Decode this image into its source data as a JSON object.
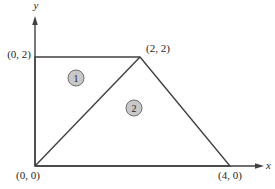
{
  "figure": {
    "background_color": "#ffffff",
    "line_color": "#404040",
    "label_color": "#1f1f1f",
    "axes": {
      "x_label": "x",
      "y_label": "y",
      "origin_px": {
        "x": 35,
        "y": 166
      },
      "x_axis_end_px": {
        "x": 256,
        "y": 166
      },
      "x_arrow_tip_px": {
        "x": 264,
        "y": 166
      },
      "y_axis_end_px": {
        "x": 35,
        "y": 24
      },
      "y_arrow_tip_px": {
        "x": 35,
        "y": 16
      },
      "x_label_px": {
        "x": 266,
        "y": 169
      },
      "y_label_px": {
        "x": 36,
        "y": 9
      }
    },
    "shape": {
      "outline_px": [
        [
          35,
          166
        ],
        [
          35,
          57
        ],
        [
          140,
          57
        ],
        [
          230,
          166
        ]
      ],
      "diagonal_px": [
        [
          35,
          166
        ],
        [
          140,
          57
        ]
      ]
    },
    "vertex_labels": [
      {
        "text": "(0, 2)",
        "x": 31,
        "y": 58,
        "anchor": "end"
      },
      {
        "text": "(2, 2)",
        "x": 146,
        "y": 52,
        "anchor": "start"
      },
      {
        "text": "(0, 0)",
        "x": 28,
        "y": 179,
        "anchor": "middle"
      },
      {
        "text": "(4, 0)",
        "x": 230,
        "y": 179,
        "anchor": "middle"
      }
    ],
    "region_markers": [
      {
        "text": "1",
        "cx": 76,
        "cy": 78,
        "r": 8,
        "fill": "#c8c8c8",
        "stroke": "#6e6e6e"
      },
      {
        "text": "2",
        "cx": 134,
        "cy": 108,
        "r": 8,
        "fill": "#c8c8c8",
        "stroke": "#6e6e6e"
      }
    ]
  }
}
